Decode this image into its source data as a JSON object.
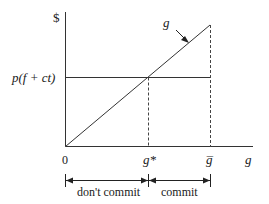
{
  "diagram": {
    "y_axis_label": "$",
    "x_axis_label": "g",
    "origin_label": "0",
    "horizontal_line_label": "p(f + ct)",
    "curve_label": "g",
    "threshold_label": "g*",
    "max_label": "g̅",
    "regions": [
      {
        "label": "don't commit"
      },
      {
        "label": "commit"
      }
    ],
    "colors": {
      "line": "#333333",
      "text": "#1a1a1a",
      "background": "#ffffff"
    }
  }
}
